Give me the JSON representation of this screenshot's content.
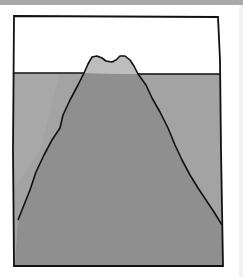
{
  "illustration": {
    "subject": "iceberg",
    "colors": {
      "sky": "#ffffff",
      "water": "#a3a3a3",
      "ice_above": "#bdbdbd",
      "ice_below": "#8f8f8f",
      "outline": "#111111",
      "top_strip": "#a9a9a9"
    }
  }
}
